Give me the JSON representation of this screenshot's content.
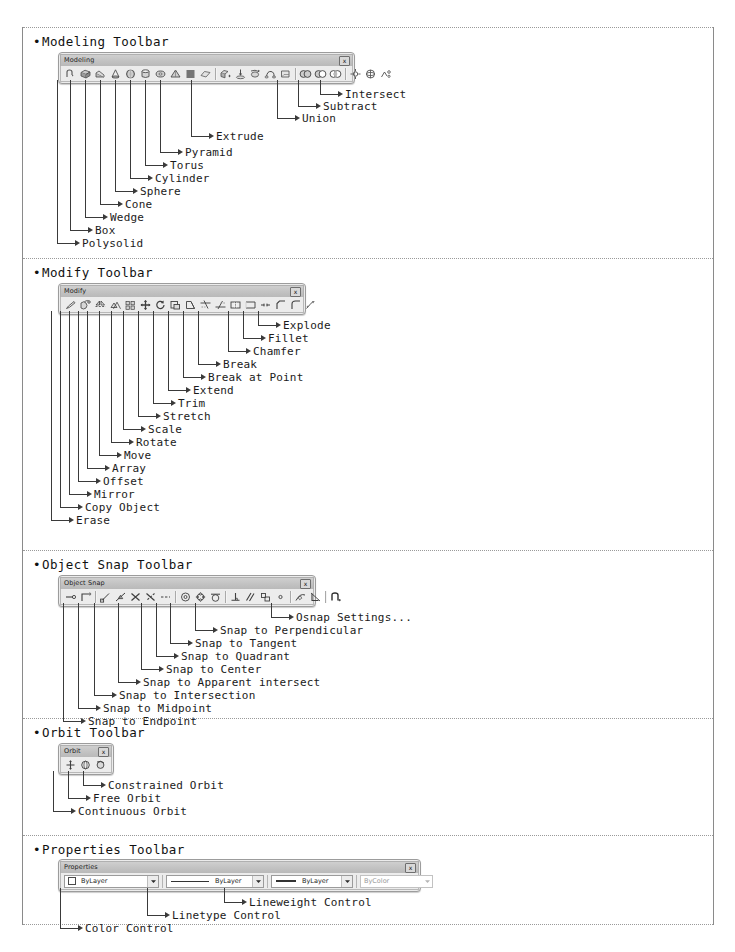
{
  "sections": [
    {
      "id": "modeling",
      "title": "Modeling Toolbar",
      "toolbar": {
        "caption": "Modeling",
        "close_label": "x",
        "icons": [
          "polysolid-icon",
          "box-icon",
          "wedge-icon",
          "cone-icon",
          "sphere-icon",
          "cylinder-icon",
          "torus-icon",
          "pyramid-icon",
          "helix-icon",
          "planar-surface-icon",
          "divider",
          "extrude-icon",
          "press-pull-icon",
          "revolve-icon",
          "sweep-icon",
          "loft-icon",
          "divider",
          "union-icon",
          "subtract-icon",
          "intersect-icon",
          "divider",
          "3d-move-icon",
          "3d-rotate-icon",
          "3d-align-icon"
        ]
      },
      "callouts": [
        {
          "label": "Intersect"
        },
        {
          "label": "Subtract"
        },
        {
          "label": "Union"
        },
        {
          "label": "Extrude"
        },
        {
          "label": "Pyramid"
        },
        {
          "label": "Torus"
        },
        {
          "label": "Cylinder"
        },
        {
          "label": "Sphere"
        },
        {
          "label": "Cone"
        },
        {
          "label": "Wedge"
        },
        {
          "label": "Box"
        },
        {
          "label": "Polysolid"
        }
      ]
    },
    {
      "id": "modify",
      "title": "Modify Toolbar",
      "toolbar": {
        "caption": "Modify",
        "close_label": "x",
        "icons": [
          "erase-icon",
          "copy-object-icon",
          "mirror-icon",
          "offset-icon",
          "array-icon",
          "move-icon",
          "rotate-icon",
          "scale-icon",
          "stretch-icon",
          "trim-icon",
          "extend-icon",
          "break-at-point-icon",
          "break-icon",
          "join-icon",
          "chamfer-icon",
          "fillet-icon",
          "explode-icon"
        ]
      },
      "callouts": [
        {
          "label": "Explode"
        },
        {
          "label": "Fillet"
        },
        {
          "label": "Chamfer"
        },
        {
          "label": "Break"
        },
        {
          "label": "Break at Point"
        },
        {
          "label": "Extend"
        },
        {
          "label": "Trim"
        },
        {
          "label": "Stretch"
        },
        {
          "label": "Scale"
        },
        {
          "label": "Rotate"
        },
        {
          "label": "Move"
        },
        {
          "label": "Array"
        },
        {
          "label": "Offset"
        },
        {
          "label": "Mirror"
        },
        {
          "label": "Copy Object"
        },
        {
          "label": "Erase"
        }
      ]
    },
    {
      "id": "object-snap",
      "title": "Object Snap Toolbar",
      "toolbar": {
        "caption": "Object Snap",
        "close_label": "x",
        "icons": [
          "temporary-track-point-icon",
          "snap-from-icon",
          "divider",
          "snap-endpoint-icon",
          "snap-midpoint-icon",
          "snap-intersection-icon",
          "snap-apparent-intersect-icon",
          "snap-extension-icon",
          "divider",
          "snap-center-icon",
          "snap-quadrant-icon",
          "snap-tangent-icon",
          "divider",
          "snap-perpendicular-icon",
          "snap-parallel-icon",
          "snap-insert-icon",
          "snap-node-icon",
          "divider",
          "snap-nearest-icon",
          "snap-none-icon",
          "divider",
          "osnap-settings-icon"
        ]
      },
      "callouts": [
        {
          "label": "Osnap Settings..."
        },
        {
          "label": "Snap to Perpendicular"
        },
        {
          "label": "Snap to Tangent"
        },
        {
          "label": "Snap to Quadrant"
        },
        {
          "label": "Snap to Center"
        },
        {
          "label": "Snap to Apparent intersect"
        },
        {
          "label": "Snap to Intersection"
        },
        {
          "label": "Snap to Midpoint"
        },
        {
          "label": "Snap to Endpoint"
        }
      ]
    },
    {
      "id": "orbit",
      "title": "Orbit Toolbar",
      "toolbar": {
        "caption": "Orbit",
        "close_label": "x",
        "icons": [
          "constrained-orbit-icon",
          "free-orbit-icon",
          "continuous-orbit-icon"
        ]
      },
      "callouts": [
        {
          "label": "Constrained Orbit"
        },
        {
          "label": "Free Orbit"
        },
        {
          "label": "Continuous Orbit"
        }
      ]
    },
    {
      "id": "properties",
      "title": "Properties Toolbar",
      "toolbar": {
        "caption": "Properties",
        "close_label": "x",
        "combos": [
          {
            "name": "color-control",
            "value": "ByLayer",
            "swatch": "#ffffff",
            "dim": false
          },
          {
            "name": "linetype-control",
            "value": "ByLayer",
            "dim": false
          },
          {
            "name": "lineweight-control",
            "value": "ByLayer",
            "dim": false
          },
          {
            "name": "plot-style-control",
            "value": "ByColor",
            "dim": true
          }
        ]
      },
      "callouts": [
        {
          "label": "Lineweight Control"
        },
        {
          "label": "Linetype Control"
        },
        {
          "label": "Color Control"
        }
      ]
    }
  ]
}
